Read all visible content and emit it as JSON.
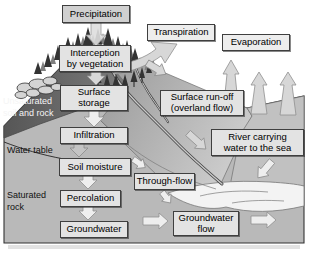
{
  "diagram_type": "water-cycle-cross-section",
  "boxes": {
    "precipitation": "Precipitation",
    "transpiration": "Transpiration",
    "evaporation": "Evaporation",
    "interception": "Interception\nby vegetation",
    "surface_storage": "Surface\nstorage",
    "surface_runoff": "Surface run-off\n(overland flow)",
    "infiltration": "Infiltration",
    "river": "River carrying\nwater to the sea",
    "soil_moisture": "Soil moisture",
    "through_flow": "Through-flow",
    "percolation": "Percolation",
    "groundwater": "Groundwater",
    "groundwater_flow": "Groundwater\nflow"
  },
  "zone_labels": {
    "unsaturated": "Unsaturated\nsoil and rock",
    "water_table": "Water table",
    "saturated": "Saturated\nrock"
  },
  "colors": {
    "box-fill": "#e3e3e3",
    "box-fill-dark": "#d0d0d0",
    "box-fill-light": "#ededed",
    "box-border": "#3f3f3f",
    "sky": "#ffffff",
    "land": "#b9b9b9",
    "dark-face": "#686868",
    "sea": "#c1c1c1",
    "wave": "#f3f3f3",
    "arrow-fill": "#d7d7d7",
    "arrow-light": "#eeeeee",
    "arrow-outline": "#8f8f8f",
    "tree-dark": "#333333",
    "tree-light": "#7f7f7f",
    "rock-fill": "#d4d4d4",
    "outline": "#333333",
    "label-light": "#f5f5f5",
    "label-dark": "#111111"
  }
}
